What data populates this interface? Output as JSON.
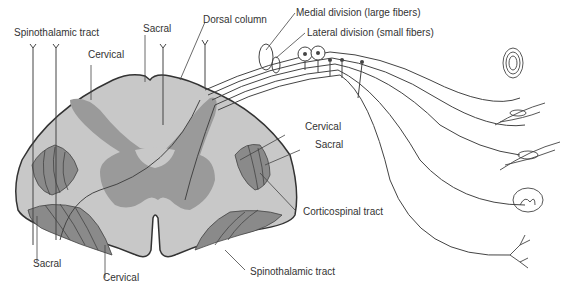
{
  "colors": {
    "white_matter": "#c8c8c8",
    "gray_matter": "#9a9a9a",
    "tract": "#8a8a8a",
    "outline": "#333333",
    "line": "#444444",
    "text": "#333333"
  },
  "labels": {
    "spinothalamic_top": "Spinothalamic tract",
    "cervical_top": "Cervical",
    "sacral_top": "Sacral",
    "dorsal_column": "Dorsal column",
    "medial_division": "Medial division (large fibers)",
    "lateral_division": "Lateral division (small fibers)",
    "cervical_right": "Cervical",
    "sacral_right": "Sacral",
    "corticospinal": "Corticospinal tract",
    "spinothalamic_bottom": "Spinothalamic tract",
    "sacral_bottom": "Sacral",
    "cervical_bottom": "Cervical"
  },
  "receptors": [
    "pacinian-corpuscle",
    "muscle-spindle",
    "golgi-tendon-organ",
    "meissner-corpuscle",
    "free-nerve-ending"
  ]
}
